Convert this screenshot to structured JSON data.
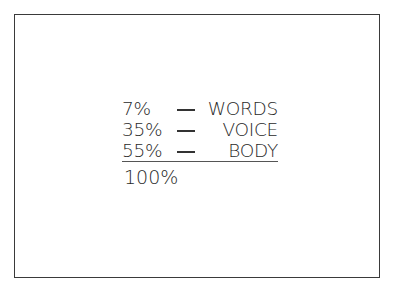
{
  "rows": [
    {
      "percent": "7%",
      "separator": "—",
      "label": "WORDS"
    },
    {
      "percent": "35%",
      "separator": "—",
      "label": "VOICE"
    },
    {
      "percent": "55%",
      "separator": "—",
      "label": "BODY"
    }
  ],
  "total": "100%",
  "colors": {
    "text": "#2a2a2a",
    "border": "#3a3a3a",
    "background": "#ffffff"
  }
}
